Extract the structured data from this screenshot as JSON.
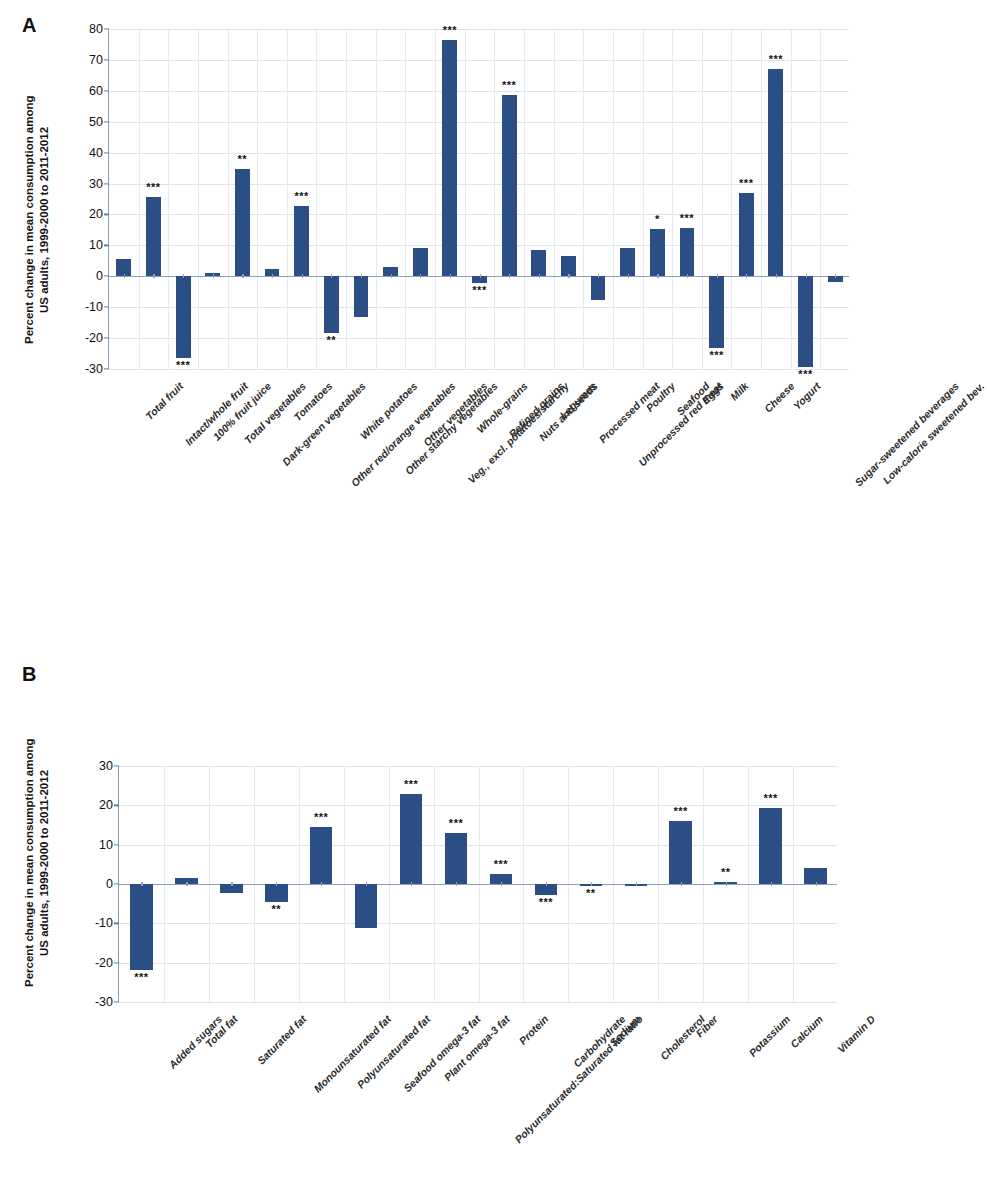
{
  "figure": {
    "panels": [
      {
        "letter": "A",
        "ylabel": "Percent change in mean consumption among\nUS adults, 1999-2000 to 2011-2012",
        "yticks": [
          "80",
          "70",
          "60",
          "50",
          "40",
          "30",
          "20",
          "10",
          "0",
          "-10",
          "-20",
          "-30"
        ]
      },
      {
        "letter": "B",
        "ylabel": "Percent change in mean consumption among\nUS adults, 1999-2000 to 2011-2012",
        "yticks": [
          "30",
          "20",
          "10",
          "0",
          "-10",
          "-20",
          "-30"
        ]
      }
    ]
  },
  "chart_data": [
    {
      "type": "bar",
      "panel": "A",
      "title": "",
      "xlabel": "",
      "ylabel": "Percent change in mean consumption among US adults, 1999-2000 to 2011-2012",
      "ylim": [
        -30,
        80
      ],
      "ytick_values": [
        -30,
        -20,
        -10,
        0,
        10,
        20,
        30,
        40,
        50,
        60,
        70,
        80
      ],
      "grid": true,
      "legend": "none",
      "bar_color": "#2b4f84",
      "categories": [
        "Total fruit",
        "Intact/whole fruit",
        "100% fruit juice",
        "Total vegetables",
        "Dark-green vegetables",
        "Tomatoes",
        "Other red/orange vegetables",
        "White potatoes",
        "Other starchy vegetables",
        "Other vegetables",
        "Veg., excl. potatoes/starchy",
        "Whole-grains",
        "Refined grains",
        "Nuts and seeds",
        "Legumes",
        "Processed meat",
        "Unprocessed red meat",
        "Poultry",
        "Seafood",
        "Eggs",
        "Milk",
        "Cheese",
        "Yogurt",
        "Sugar-sweetened beverages",
        "Low-calorie sweetened bev."
      ],
      "values": [
        5.5,
        25.8,
        -26.3,
        1.2,
        34.8,
        2.2,
        22.8,
        -18.2,
        -13.2,
        3.0,
        9.0,
        76.6,
        -2.3,
        58.5,
        8.4,
        6.4,
        -7.7,
        9.3,
        15.4,
        15.5,
        -23.2,
        27.0,
        67.2,
        -29.4,
        -1.8
      ],
      "significance": [
        "",
        "***",
        "***",
        "",
        "**",
        "",
        "***",
        "**",
        "",
        "",
        "",
        "***",
        "***",
        "***",
        "",
        "",
        "",
        "",
        "*",
        "***",
        "***",
        "***",
        "***",
        "***",
        ""
      ]
    },
    {
      "type": "bar",
      "panel": "B",
      "title": "",
      "xlabel": "",
      "ylabel": "Percent change in mean consumption among US adults, 1999-2000 to 2011-2012",
      "ylim": [
        -30,
        30
      ],
      "ytick_values": [
        -30,
        -20,
        -10,
        0,
        10,
        20,
        30
      ],
      "grid": true,
      "legend": "none",
      "bar_color": "#2b4f84",
      "categories": [
        "Added sugars",
        "Total fat",
        "Saturated fat",
        "Monounsaturated fat",
        "Polyunsaturated fat",
        "Seafood omega-3 fat",
        "Plant omega-3 fat",
        "Polyunsaturated:Saturated fat ratio",
        "Protein",
        "Carbohydrate",
        "Sodium",
        "Cholesterol",
        "Fiber",
        "Potassium",
        "Calcium",
        "Vitamin D"
      ],
      "values": [
        -21.8,
        1.6,
        -2.2,
        -4.5,
        14.6,
        -11.2,
        23.0,
        13.0,
        2.5,
        -2.8,
        -0.5,
        -0.3,
        15.9,
        0.6,
        19.3,
        4.0
      ],
      "significance": [
        "***",
        "",
        "",
        "**",
        "***",
        "",
        "***",
        "***",
        "***",
        "***",
        "**",
        "",
        "***",
        "**",
        "***",
        ""
      ]
    }
  ]
}
